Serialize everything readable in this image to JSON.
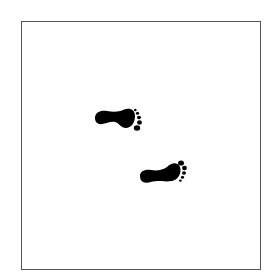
{
  "image": {
    "description": "Two black footprints walking diagonally inside a square frame",
    "frame_color": "#555555",
    "background_color": "#ffffff",
    "footprint_color": "#000000"
  },
  "footprints": [
    {
      "name": "footprint-upper-left",
      "direction": "right"
    },
    {
      "name": "footprint-lower-right",
      "direction": "right"
    }
  ]
}
